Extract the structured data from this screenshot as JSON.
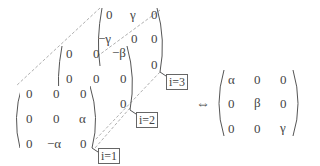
{
  "diagram": {
    "stack": [
      {
        "label": "i=3",
        "rows": [
          [
            "0",
            "γ",
            "0"
          ],
          [
            "−γ",
            "0",
            "0"
          ],
          [
            "0",
            "0",
            "0"
          ]
        ]
      },
      {
        "label": "i=2",
        "rows": [
          [
            "0",
            "0",
            "−β"
          ],
          [
            "0",
            "0",
            "0"
          ],
          [
            "β",
            "0",
            "0"
          ]
        ]
      },
      {
        "label": "i=1",
        "rows": [
          [
            "0",
            "0",
            "0"
          ],
          [
            "0",
            "0",
            "α"
          ],
          [
            "0",
            "−α",
            "0"
          ]
        ]
      }
    ],
    "equivalence_symbol": "⇔",
    "result": {
      "rows": [
        [
          "α",
          "0",
          "0"
        ],
        [
          "0",
          "β",
          "0"
        ],
        [
          "0",
          "0",
          "γ"
        ]
      ]
    }
  }
}
